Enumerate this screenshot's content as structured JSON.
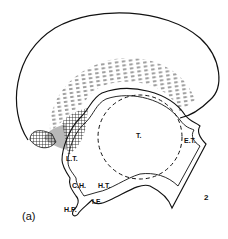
{
  "figure": {
    "panel_label": "(a)",
    "panel_number": "2",
    "labels": {
      "t": "T.",
      "et": "E.T.",
      "lt": "L.T.",
      "ch": "C.H.",
      "ht": "H.T.",
      "if": "I.F.",
      "hp": "H.P."
    },
    "colors": {
      "line": "#111111",
      "background": "#ffffff"
    }
  }
}
